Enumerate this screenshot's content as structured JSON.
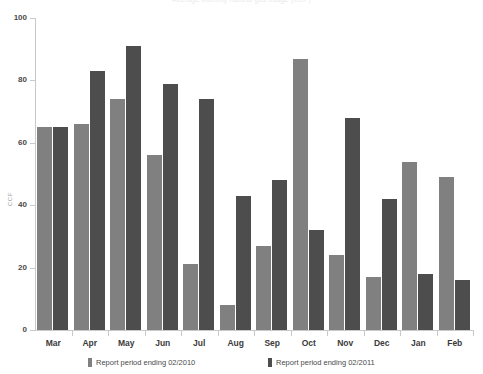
{
  "chart_data": {
    "type": "bar",
    "title": "Average monthly natural gas usage (CCF)",
    "xlabel": "",
    "ylabel": "CCF",
    "ylim": [
      0,
      100
    ],
    "yticks": [
      0,
      20,
      40,
      60,
      80,
      100
    ],
    "grid": false,
    "legend_position": "bottom",
    "categories": [
      "Mar",
      "Apr",
      "May",
      "Jun",
      "Jul",
      "Aug",
      "Sep",
      "Oct",
      "Nov",
      "Dec",
      "Jan",
      "Feb"
    ],
    "series": [
      {
        "name": "Report period ending 02/2010",
        "color": "#808080",
        "values": [
          65,
          66,
          74,
          56,
          21,
          8,
          27,
          87,
          24,
          17,
          54,
          49
        ]
      },
      {
        "name": "Report period ending 02/2011",
        "color": "#4d4d4d",
        "values": [
          65,
          83,
          91,
          79,
          74,
          43,
          48,
          32,
          68,
          42,
          18,
          16
        ]
      }
    ]
  },
  "axis": {
    "y_label": "CCF",
    "y_tick_labels": [
      "100",
      "80",
      "60",
      "40",
      "20",
      "0"
    ]
  },
  "legend": {
    "items": [
      {
        "label": "Report period ending 02/2010",
        "color": "#808080"
      },
      {
        "label": "Report period ending 02/2011",
        "color": "#4d4d4d"
      }
    ]
  }
}
